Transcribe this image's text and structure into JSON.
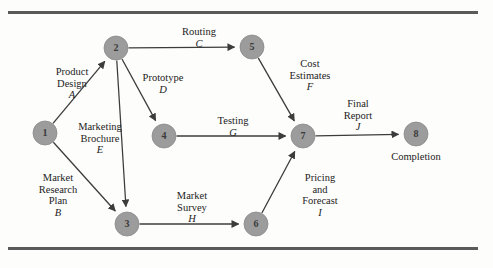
{
  "figure": {
    "node_fill": "#9c9c9c",
    "node_stroke": "#8a8a8a",
    "edge_color": "#3c3c3c",
    "rule_color": "#5a5a5a",
    "background": "#fdfdfb"
  },
  "nodes": [
    {
      "id": "1",
      "label": "1",
      "x": 45,
      "y": 133,
      "r": 12
    },
    {
      "id": "2",
      "label": "2",
      "x": 116,
      "y": 48,
      "r": 12
    },
    {
      "id": "3",
      "label": "3",
      "x": 127,
      "y": 224,
      "r": 12
    },
    {
      "id": "4",
      "label": "4",
      "x": 164,
      "y": 136,
      "r": 12
    },
    {
      "id": "5",
      "label": "5",
      "x": 252,
      "y": 47,
      "r": 12
    },
    {
      "id": "6",
      "label": "6",
      "x": 256,
      "y": 224,
      "r": 12
    },
    {
      "id": "7",
      "label": "7",
      "x": 303,
      "y": 136,
      "r": 12
    },
    {
      "id": "8",
      "label": "8",
      "x": 416,
      "y": 134,
      "r": 12
    }
  ],
  "edges": [
    {
      "from": "1",
      "to": "2",
      "activity": "A",
      "name_lines": [
        "Product",
        "Design"
      ],
      "label_x": 72,
      "label_y": 66
    },
    {
      "from": "1",
      "to": "3",
      "activity": "B",
      "name_lines": [
        "Market",
        "Research",
        "Plan"
      ],
      "label_x": 58,
      "label_y": 172
    },
    {
      "from": "2",
      "to": "5",
      "activity": "C",
      "name_lines": [
        "Routing"
      ],
      "label_x": 199,
      "label_y": 26
    },
    {
      "from": "2",
      "to": "4",
      "activity": "D",
      "name_lines": [
        "Prototype"
      ],
      "label_x": 163,
      "label_y": 72
    },
    {
      "from": "2",
      "to": "3",
      "activity": "E",
      "name_lines": [
        "Marketing",
        "Brochure"
      ],
      "label_x": 100,
      "label_y": 121
    },
    {
      "from": "5",
      "to": "7",
      "activity": "F",
      "name_lines": [
        "Cost",
        "Estimates"
      ],
      "label_x": 310,
      "label_y": 58
    },
    {
      "from": "4",
      "to": "7",
      "activity": "G",
      "name_lines": [
        "Testing"
      ],
      "label_x": 233,
      "label_y": 115
    },
    {
      "from": "3",
      "to": "6",
      "activity": "H",
      "name_lines": [
        "Market",
        "Survey"
      ],
      "label_x": 192,
      "label_y": 190
    },
    {
      "from": "6",
      "to": "7",
      "activity": "I",
      "name_lines": [
        "Pricing",
        "and",
        "Forecast"
      ],
      "label_x": 320,
      "label_y": 172
    },
    {
      "from": "7",
      "to": "8",
      "activity": "J",
      "name_lines": [
        "Final",
        "Report"
      ],
      "label_x": 358,
      "label_y": 98
    }
  ],
  "captions": [
    {
      "id": "completion",
      "text": "Completion",
      "x": 416,
      "y": 151
    }
  ],
  "chart_data": {
    "type": "diagram",
    "node_ids": [
      "1",
      "2",
      "3",
      "4",
      "5",
      "6",
      "7",
      "8"
    ],
    "activities": [
      {
        "code": "A",
        "name": "Product Design",
        "from": "1",
        "to": "2"
      },
      {
        "code": "B",
        "name": "Market Research Plan",
        "from": "1",
        "to": "3"
      },
      {
        "code": "C",
        "name": "Routing",
        "from": "2",
        "to": "5"
      },
      {
        "code": "D",
        "name": "Prototype",
        "from": "2",
        "to": "4"
      },
      {
        "code": "E",
        "name": "Marketing Brochure",
        "from": "2",
        "to": "3"
      },
      {
        "code": "F",
        "name": "Cost Estimates",
        "from": "5",
        "to": "7"
      },
      {
        "code": "G",
        "name": "Testing",
        "from": "4",
        "to": "7"
      },
      {
        "code": "H",
        "name": "Market Survey",
        "from": "3",
        "to": "6"
      },
      {
        "code": "I",
        "name": "Pricing and Forecast",
        "from": "6",
        "to": "7"
      },
      {
        "code": "J",
        "name": "Final Report",
        "from": "7",
        "to": "8"
      }
    ],
    "terminal_label": "Completion"
  }
}
